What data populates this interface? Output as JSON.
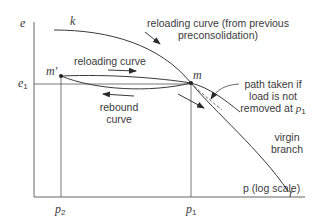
{
  "diagram": {
    "type": "e-log p consolidation curve",
    "axes": {
      "y_label": "e",
      "x_label": "p (log scale)",
      "y_tick": {
        "label": "e",
        "subscript": "1"
      },
      "x_ticks": [
        {
          "label": "p",
          "subscript": "2"
        },
        {
          "label": "p",
          "subscript": "1"
        }
      ]
    },
    "points": {
      "k": "k",
      "m_prime": "m′",
      "m": "m",
      "r": "r"
    },
    "annotations": {
      "reloading_previous_line1": "reloading curve (from previous",
      "reloading_previous_line2": "preconsolidation)",
      "reloading_curve": "reloading curve",
      "rebound_line1": "rebound",
      "rebound_line2": "curve",
      "path_line1": "path taken if",
      "path_line2": "load is not",
      "path_line3": "removed at",
      "path_p": "p",
      "path_p_sub": "1",
      "virgin_line1": "virgin",
      "virgin_line2": "branch"
    },
    "colors": {
      "line": "#3a3a3a",
      "background": "#ffffff"
    }
  }
}
